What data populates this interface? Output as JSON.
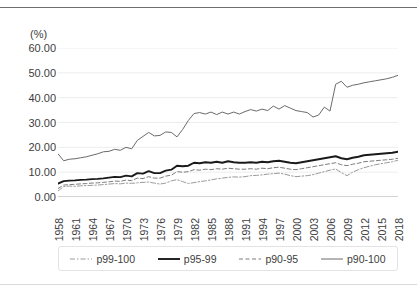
{
  "axis": {
    "y_unit": "(%)",
    "y_ticks": [
      "60.00",
      "50.00",
      "40.00",
      "30.00",
      "20.00",
      "10.00",
      "0.00"
    ],
    "x_ticks": [
      "1958",
      "1961",
      "1964",
      "1967",
      "1970",
      "1973",
      "1976",
      "1979",
      "1982",
      "1985",
      "1988",
      "1991",
      "1994",
      "1997",
      "2000",
      "2003",
      "2006",
      "2009",
      "2012",
      "2015",
      "2018"
    ]
  },
  "legend": {
    "items": [
      {
        "label": "p99-100",
        "style": "dash-dot",
        "color": "#9a9a9a"
      },
      {
        "label": "p95-99",
        "style": "solid-thick",
        "color": "#1a1a1a"
      },
      {
        "label": "p90-95",
        "style": "dashed",
        "color": "#7d7d7d"
      },
      {
        "label": "p90-100",
        "style": "solid-thin",
        "color": "#6b6b6b"
      }
    ]
  },
  "colors": {
    "gridline": "#ededed",
    "axis": "#a6a6a6",
    "text": "#3d3d3d",
    "series_p99_100": "#9a9a9a",
    "series_p95_99": "#1a1a1a",
    "series_p90_95": "#7d7d7d",
    "series_p90_100": "#6b6b6b"
  },
  "chart_data": {
    "type": "line",
    "title": "",
    "subtitle": "",
    "xlabel": "",
    "ylabel": "(%)",
    "ylim": [
      0,
      60
    ],
    "yticks": [
      0,
      10,
      20,
      30,
      40,
      50,
      60
    ],
    "grid": true,
    "legend_position": "bottom",
    "x": [
      1958,
      1959,
      1960,
      1961,
      1962,
      1963,
      1964,
      1965,
      1966,
      1967,
      1968,
      1969,
      1970,
      1971,
      1972,
      1973,
      1974,
      1975,
      1976,
      1977,
      1978,
      1979,
      1980,
      1981,
      1982,
      1983,
      1984,
      1985,
      1986,
      1987,
      1988,
      1989,
      1990,
      1991,
      1992,
      1993,
      1994,
      1995,
      1996,
      1997,
      1998,
      1999,
      2000,
      2001,
      2002,
      2003,
      2004,
      2005,
      2006,
      2007,
      2008,
      2009,
      2010,
      2011,
      2012,
      2013,
      2014,
      2015,
      2016,
      2017,
      2018
    ],
    "series": [
      {
        "name": "p99-100",
        "style": "dash-dot",
        "values": [
          2.4,
          4.2,
          4.4,
          4.3,
          4.5,
          4.6,
          4.7,
          4.8,
          5.0,
          5.2,
          5.4,
          5.3,
          5.6,
          5.5,
          5.7,
          5.9,
          6.0,
          5.6,
          5.2,
          5.6,
          6.5,
          7.0,
          6.2,
          5.4,
          5.8,
          6.2,
          6.5,
          6.9,
          7.3,
          7.6,
          7.9,
          8.1,
          8.0,
          8.2,
          8.6,
          8.7,
          8.9,
          9.2,
          9.4,
          9.6,
          9.2,
          8.6,
          8.2,
          8.4,
          8.6,
          9.0,
          9.6,
          10.2,
          10.8,
          11.3,
          9.8,
          8.6,
          10.0,
          11.0,
          11.8,
          12.4,
          13.0,
          13.4,
          13.8,
          14.2,
          14.8
        ]
      },
      {
        "name": "p95-99",
        "style": "solid-thick",
        "values": [
          5.4,
          6.4,
          6.6,
          6.7,
          6.9,
          7.0,
          7.2,
          7.3,
          7.5,
          7.8,
          8.1,
          8.0,
          8.6,
          8.3,
          9.6,
          9.4,
          10.4,
          9.6,
          9.6,
          10.6,
          11.0,
          12.6,
          12.4,
          12.6,
          13.8,
          13.6,
          14.0,
          13.8,
          14.2,
          13.8,
          14.4,
          14.0,
          13.8,
          13.8,
          14.0,
          13.8,
          14.2,
          14.0,
          14.4,
          14.6,
          14.2,
          13.8,
          13.6,
          14.0,
          14.4,
          14.8,
          15.2,
          15.6,
          16.0,
          16.4,
          15.6,
          15.2,
          15.8,
          16.2,
          16.8,
          17.0,
          17.2,
          17.4,
          17.6,
          17.8,
          18.2
        ]
      },
      {
        "name": "p90-95",
        "style": "dashed",
        "values": [
          3.4,
          4.8,
          5.0,
          5.1,
          5.3,
          5.4,
          5.6,
          5.7,
          5.9,
          6.1,
          6.4,
          6.3,
          6.8,
          6.6,
          7.6,
          7.4,
          8.2,
          7.6,
          7.6,
          8.4,
          8.8,
          10.2,
          10.0,
          10.2,
          11.0,
          10.8,
          11.2,
          11.0,
          11.4,
          11.2,
          11.6,
          11.4,
          11.2,
          11.2,
          11.4,
          11.2,
          11.6,
          11.4,
          11.8,
          12.0,
          11.6,
          11.2,
          11.0,
          11.4,
          11.8,
          12.2,
          12.6,
          13.0,
          13.4,
          13.8,
          13.0,
          12.6,
          13.2,
          13.6,
          14.2,
          14.4,
          14.6,
          14.8,
          15.0,
          15.2,
          15.6
        ]
      },
      {
        "name": "p90-100",
        "style": "solid-thin",
        "values": [
          17.4,
          14.6,
          15.2,
          15.4,
          15.8,
          16.2,
          16.8,
          17.4,
          18.2,
          18.4,
          19.2,
          18.8,
          20.0,
          19.4,
          22.8,
          24.4,
          26.0,
          24.6,
          24.8,
          26.2,
          26.0,
          24.2,
          27.2,
          30.8,
          33.6,
          34.0,
          33.4,
          34.2,
          33.2,
          34.2,
          33.4,
          34.2,
          33.4,
          34.4,
          35.2,
          34.6,
          35.4,
          34.8,
          36.6,
          35.4,
          36.8,
          35.8,
          34.8,
          34.4,
          34.0,
          32.2,
          33.0,
          36.2,
          34.6,
          45.4,
          46.6,
          44.2,
          45.0,
          45.4,
          46.0,
          46.4,
          46.8,
          47.2,
          47.6,
          48.2,
          49.0
        ]
      }
    ]
  }
}
